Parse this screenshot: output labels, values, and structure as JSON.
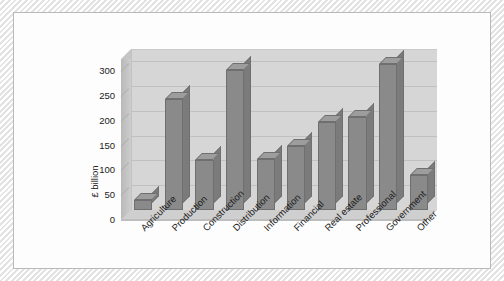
{
  "chart_data": {
    "type": "bar",
    "title": "",
    "subtitle": "",
    "xlabel": "",
    "ylabel": "£ billion",
    "categories": [
      "Agriculture",
      "Production",
      "Construction",
      "Distribution",
      "Information",
      "Financial",
      "Real estate",
      "Professional",
      "Government",
      "Other"
    ],
    "values": [
      20,
      225,
      100,
      282,
      103,
      130,
      178,
      188,
      295,
      70
    ],
    "series": [
      {
        "name": "",
        "values": [
          20,
          225,
          100,
          282,
          103,
          130,
          178,
          188,
          295,
          70
        ]
      }
    ],
    "ylim": [
      0,
      325
    ],
    "yticks": [
      0,
      50,
      100,
      150,
      200,
      250,
      300
    ],
    "ytick_labels": [
      "0",
      "50",
      "100",
      "150",
      "200",
      "250",
      "300"
    ],
    "grid": true,
    "legend": "none",
    "style": "3d-column",
    "colors": {
      "bar_front": "#8a8a8a",
      "bar_top": "#9d9d9d",
      "bar_side": "#7b7b7b",
      "bar_outline": "#6f6f6f",
      "plot_background": "#d6d6d6",
      "gridline": "#c0c0c0",
      "page_background": "#fdfdfd",
      "frame": "#e3e3e3",
      "text": "#1d1d1d"
    }
  }
}
